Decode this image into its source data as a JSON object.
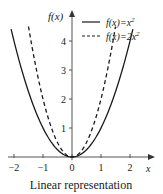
{
  "chart_data": {
    "type": "line",
    "title": "",
    "caption": "Linear representation",
    "xlabel": "x",
    "ylabel": "f(x)",
    "xlim": [
      -2.1,
      2.2
    ],
    "ylim": [
      0,
      4.6
    ],
    "x_ticks": [
      -2,
      -1,
      0,
      1,
      2
    ],
    "x_tick_labels": [
      "−2",
      "−1",
      "0",
      "1",
      "2"
    ],
    "y_ticks": [
      1,
      2,
      3,
      4
    ],
    "y_tick_labels": [
      "1",
      "2",
      "3",
      "4"
    ],
    "grid": false,
    "legend_position": "upper right",
    "series": [
      {
        "name": "f(x)=x²",
        "formula": "x^2",
        "style": "solid",
        "x_range": [
          -2.1,
          2.1
        ]
      },
      {
        "name": "f(x)=2x²",
        "formula": "2x^2",
        "style": "dashed",
        "x_range": [
          -1.5,
          1.5
        ]
      }
    ]
  },
  "legend": {
    "solid_label": "f(x)=x",
    "solid_sup": "2",
    "dashed_label": "f(x)=2x",
    "dashed_sup": "2"
  },
  "axes": {
    "x_label": "x",
    "y_label": "f(x)"
  },
  "caption": "Linear representation",
  "colors": {
    "line": "#1a1a1a",
    "axis": "#555555"
  }
}
